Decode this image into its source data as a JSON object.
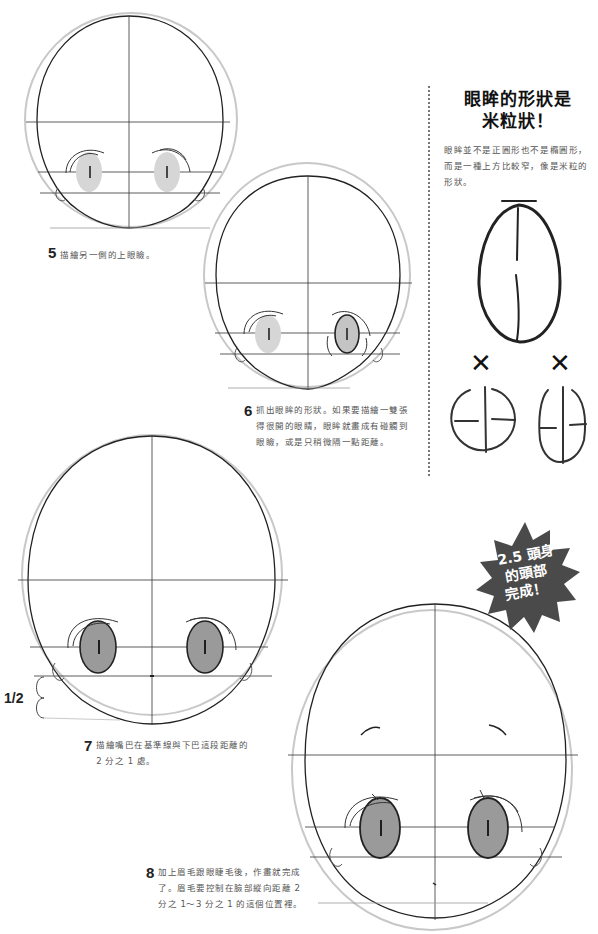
{
  "sidebar": {
    "title_line1": "眼眸的形狀是",
    "title_line2": "米粒狀！",
    "body": "眼眸並不是正圓形也不是橢圓形，而是一種上方比較窄，像是米粒的形狀。",
    "wrong_mark_1": "✕",
    "wrong_mark_2": "✕"
  },
  "steps": [
    {
      "number": "5",
      "text": "描繪另一側的上眼瞼。"
    },
    {
      "number": "6",
      "text": "抓出眼眸的形狀。如果要描繪一雙張得很開的眼睛，眼眸就畫成有碰觸到眼瞼，或是只稍微隔一點距離。"
    },
    {
      "number": "7",
      "text": "描繪嘴巴在基準線與下巴這段距離的 2 分之 1 處。"
    },
    {
      "number": "8",
      "text": "加上眉毛跟眼睫毛後，作畫就完成了。眉毛要控制在臉部縱向距離 2 分之 1～3 分之 1 的這個位置裡。"
    }
  ],
  "badge": {
    "line1": "2.5 頭身",
    "line2": "的頭部",
    "line3": "完成！",
    "color": "#4a4a4a"
  },
  "measure": {
    "label": "1/2"
  },
  "colors": {
    "eye_light": "#d6d6d6",
    "eye_dark": "#9a9a9a",
    "line": "#222222",
    "guide": "#bbbbbb"
  }
}
